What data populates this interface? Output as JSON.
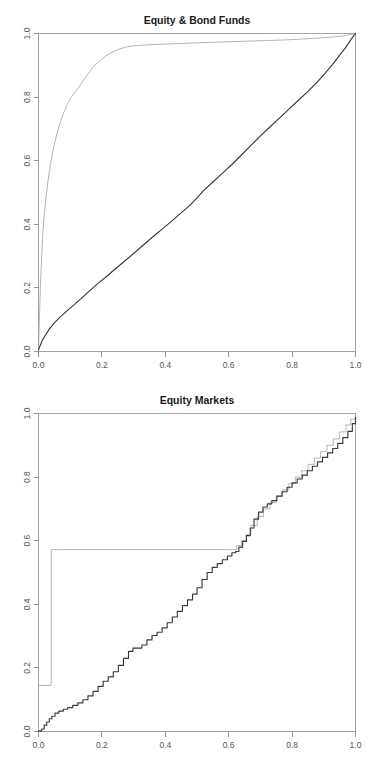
{
  "figure": {
    "background": "#ffffff",
    "width": 374,
    "height": 760,
    "panel_count": 2
  },
  "colors": {
    "dark_series": "#3a3a3a",
    "gray_series": "#a8a8a8",
    "axis": "#888888",
    "box": "#9a9a9a",
    "title": "#1a1a1a",
    "tick_label": "#555555"
  },
  "chart_data": [
    {
      "id": "equity-bond-funds",
      "type": "line",
      "title": "Equity & Bond Funds",
      "xlabel": "",
      "ylabel": "",
      "xlim": [
        0.0,
        1.0
      ],
      "ylim": [
        0.0,
        1.0
      ],
      "xticks": [
        0.0,
        0.2,
        0.4,
        0.6,
        0.8,
        1.0
      ],
      "yticks": [
        0.0,
        0.2,
        0.4,
        0.6,
        0.8,
        1.0
      ],
      "xticklabels": [
        "0.0",
        "0.2",
        "0.4",
        "0.6",
        "0.8",
        "1.0"
      ],
      "yticklabels": [
        "0.0",
        "0.2",
        "0.4",
        "0.6",
        "0.8",
        "1.0"
      ],
      "grid": false,
      "legend": "none",
      "y_axis_label_rotation": 90,
      "series": [
        {
          "name": "gray-curve",
          "color": "#a8a8a8",
          "style": "solid",
          "x": [
            0.0,
            0.003,
            0.006,
            0.01,
            0.014,
            0.018,
            0.022,
            0.026,
            0.03,
            0.035,
            0.04,
            0.045,
            0.05,
            0.056,
            0.062,
            0.068,
            0.074,
            0.08,
            0.086,
            0.092,
            0.098,
            0.105,
            0.112,
            0.12,
            0.128,
            0.136,
            0.145,
            0.155,
            0.165,
            0.175,
            0.186,
            0.198,
            0.21,
            0.225,
            0.24,
            0.258,
            0.275,
            0.292,
            0.31,
            0.34,
            0.38,
            0.43,
            0.48,
            0.54,
            0.6,
            0.66,
            0.72,
            0.78,
            0.84,
            0.89,
            0.93,
            0.96,
            0.98,
            0.992,
            1.0
          ],
          "y": [
            0.0,
            0.105,
            0.205,
            0.3,
            0.375,
            0.43,
            0.47,
            0.505,
            0.537,
            0.57,
            0.6,
            0.628,
            0.652,
            0.676,
            0.698,
            0.718,
            0.736,
            0.752,
            0.766,
            0.78,
            0.79,
            0.802,
            0.812,
            0.822,
            0.832,
            0.845,
            0.858,
            0.872,
            0.885,
            0.898,
            0.908,
            0.918,
            0.928,
            0.937,
            0.945,
            0.952,
            0.957,
            0.96,
            0.962,
            0.964,
            0.966,
            0.968,
            0.97,
            0.972,
            0.974,
            0.976,
            0.978,
            0.98,
            0.983,
            0.986,
            0.989,
            0.992,
            0.996,
            0.998,
            1.0
          ]
        },
        {
          "name": "dark-curve",
          "color": "#3a3a3a",
          "style": "solid",
          "x": [
            0.0,
            0.005,
            0.012,
            0.022,
            0.035,
            0.05,
            0.068,
            0.088,
            0.11,
            0.135,
            0.16,
            0.185,
            0.21,
            0.24,
            0.27,
            0.3,
            0.33,
            0.36,
            0.39,
            0.42,
            0.45,
            0.48,
            0.5,
            0.52,
            0.55,
            0.58,
            0.61,
            0.64,
            0.67,
            0.7,
            0.73,
            0.76,
            0.79,
            0.82,
            0.85,
            0.88,
            0.905,
            0.93,
            0.95,
            0.968,
            0.982,
            0.992,
            1.0
          ],
          "y": [
            0.005,
            0.018,
            0.035,
            0.052,
            0.072,
            0.09,
            0.108,
            0.126,
            0.145,
            0.167,
            0.19,
            0.212,
            0.232,
            0.258,
            0.283,
            0.308,
            0.334,
            0.36,
            0.385,
            0.41,
            0.436,
            0.462,
            0.483,
            0.505,
            0.533,
            0.56,
            0.588,
            0.618,
            0.648,
            0.678,
            0.706,
            0.734,
            0.762,
            0.79,
            0.818,
            0.848,
            0.876,
            0.905,
            0.932,
            0.955,
            0.975,
            0.99,
            1.0
          ]
        }
      ]
    },
    {
      "id": "equity-markets",
      "type": "line",
      "title": "Equity Markets",
      "xlabel": "",
      "ylabel": "",
      "xlim": [
        0.0,
        1.0
      ],
      "ylim": [
        0.0,
        1.0
      ],
      "xticks": [
        0.0,
        0.2,
        0.4,
        0.6,
        0.8,
        1.0
      ],
      "yticks": [
        0.0,
        0.2,
        0.4,
        0.6,
        0.8,
        1.0
      ],
      "xticklabels": [
        "0.0",
        "0.2",
        "0.4",
        "0.6",
        "0.8",
        "1.0"
      ],
      "yticklabels": [
        "0.0",
        "0.2",
        "0.4",
        "0.6",
        "0.8",
        "1.0"
      ],
      "grid": false,
      "legend": "none",
      "y_axis_label_rotation": 90,
      "series": [
        {
          "name": "gray-step",
          "color": "#a8a8a8",
          "style": "step",
          "x": [
            0.0,
            0.04,
            0.04,
            0.063,
            0.063,
            0.61,
            0.625,
            0.64,
            0.655,
            0.67,
            0.69,
            0.71,
            0.73,
            0.75,
            0.77,
            0.79,
            0.81,
            0.83,
            0.85,
            0.87,
            0.89,
            0.91,
            0.93,
            0.95,
            0.97,
            0.985,
            1.0
          ],
          "y": [
            0.145,
            0.145,
            0.572,
            0.572,
            0.572,
            0.572,
            0.585,
            0.6,
            0.62,
            0.648,
            0.676,
            0.7,
            0.72,
            0.74,
            0.76,
            0.78,
            0.8,
            0.82,
            0.84,
            0.86,
            0.88,
            0.9,
            0.92,
            0.942,
            0.964,
            0.982,
            1.0
          ]
        },
        {
          "name": "dark-step",
          "color": "#3a3a3a",
          "style": "step",
          "x": [
            0.0,
            0.01,
            0.018,
            0.026,
            0.034,
            0.042,
            0.052,
            0.064,
            0.078,
            0.092,
            0.108,
            0.124,
            0.14,
            0.156,
            0.172,
            0.188,
            0.204,
            0.22,
            0.236,
            0.252,
            0.268,
            0.284,
            0.298,
            0.312,
            0.326,
            0.342,
            0.358,
            0.374,
            0.39,
            0.406,
            0.422,
            0.438,
            0.454,
            0.47,
            0.486,
            0.5,
            0.516,
            0.532,
            0.548,
            0.564,
            0.58,
            0.596,
            0.61,
            0.622,
            0.632,
            0.644,
            0.656,
            0.668,
            0.68,
            0.694,
            0.708,
            0.722,
            0.736,
            0.752,
            0.768,
            0.784,
            0.8,
            0.816,
            0.832,
            0.848,
            0.864,
            0.88,
            0.896,
            0.912,
            0.928,
            0.944,
            0.96,
            0.976,
            0.99,
            1.0
          ],
          "y": [
            0.002,
            0.008,
            0.02,
            0.03,
            0.04,
            0.048,
            0.058,
            0.064,
            0.07,
            0.075,
            0.082,
            0.09,
            0.1,
            0.112,
            0.126,
            0.142,
            0.158,
            0.172,
            0.188,
            0.208,
            0.23,
            0.252,
            0.262,
            0.262,
            0.272,
            0.288,
            0.302,
            0.312,
            0.326,
            0.342,
            0.36,
            0.378,
            0.396,
            0.414,
            0.432,
            0.452,
            0.478,
            0.5,
            0.516,
            0.528,
            0.54,
            0.552,
            0.562,
            0.566,
            0.58,
            0.598,
            0.616,
            0.64,
            0.668,
            0.69,
            0.706,
            0.716,
            0.726,
            0.74,
            0.754,
            0.768,
            0.782,
            0.794,
            0.806,
            0.82,
            0.834,
            0.848,
            0.862,
            0.876,
            0.89,
            0.906,
            0.924,
            0.944,
            0.968,
            0.988
          ]
        }
      ]
    }
  ]
}
